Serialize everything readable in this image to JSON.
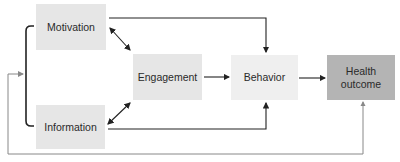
{
  "diagram": {
    "nodes": [
      {
        "id": "motivation",
        "label": "Motivation",
        "x": 36,
        "y": 4,
        "w": 70,
        "h": 46,
        "fill": "#e6e6e6"
      },
      {
        "id": "information",
        "label": "Information",
        "x": 36,
        "y": 105,
        "w": 69,
        "h": 44,
        "fill": "#e6e6e6"
      },
      {
        "id": "engagement",
        "label": "Engagement",
        "x": 133,
        "y": 54,
        "w": 69,
        "h": 46,
        "fill": "#e6e6e6"
      },
      {
        "id": "behavior",
        "label": "Behavior",
        "x": 231,
        "y": 55,
        "w": 67,
        "h": 45,
        "fill": "#efefef"
      },
      {
        "id": "health_outcome",
        "label": "Health\noutcome",
        "x": 327,
        "y": 55,
        "w": 68,
        "h": 45,
        "fill": "#b4b4b4"
      }
    ],
    "edges": [
      {
        "from": "motivation",
        "to": "engagement",
        "style": "solid",
        "color": "#222222",
        "heads": "both"
      },
      {
        "from": "information",
        "to": "engagement",
        "style": "solid",
        "color": "#222222",
        "heads": "both"
      },
      {
        "from": "engagement",
        "to": "behavior",
        "style": "solid",
        "color": "#222222",
        "heads": "end"
      },
      {
        "from": "behavior",
        "to": "health_outcome",
        "style": "solid",
        "color": "#222222",
        "heads": "end"
      },
      {
        "from": "motivation",
        "to": "behavior",
        "style": "elbow-top",
        "color": "#222222",
        "heads": "end"
      },
      {
        "from": "information",
        "to": "behavior",
        "style": "elbow-bottom",
        "color": "#222222",
        "heads": "end"
      },
      {
        "from": "health_outcome",
        "to": "motivation_information_bracket",
        "style": "feedback-loop",
        "color": "#888888",
        "heads": "end"
      }
    ],
    "groups": [
      {
        "id": "motivation_information_bracket",
        "members": [
          "motivation",
          "information"
        ],
        "color": "#222222"
      }
    ]
  }
}
